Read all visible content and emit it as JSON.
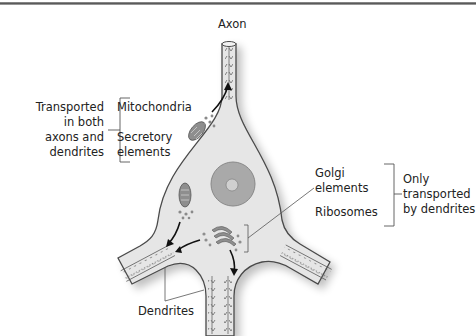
{
  "figure": {
    "type": "neuron-transport-diagram",
    "labels": {
      "axon": "Axon",
      "dendrites": "Dendrites",
      "mitochondria": "Mitochondria",
      "secretory_line1": "Secretory",
      "secretory_line2": "elements",
      "golgi_line1": "Golgi",
      "golgi_line2": "elements",
      "ribosomes": "Ribosomes"
    },
    "groups": {
      "left": {
        "line1": "Transported",
        "line2": "in both",
        "line3": "axons and",
        "line4": "dendrites"
      },
      "right": {
        "line1": "Only",
        "line2": "transported",
        "line3": "by dendrites"
      }
    },
    "colors": {
      "cell_fill": "#e6e6e6",
      "cell_outline": "#4a4a4a",
      "nucleus_fill": "#a9a9a9",
      "organelle_fill": "#8e8e8e",
      "arrow": "#111111",
      "leader_line": "#555555"
    }
  }
}
